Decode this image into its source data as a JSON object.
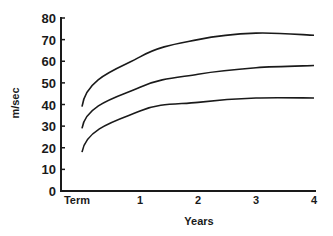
{
  "chart_data": {
    "type": "line",
    "title": "",
    "xlabel": "Years",
    "ylabel": "m/sec",
    "x_tick_labels": [
      "Term",
      "1",
      "2",
      "3",
      "4"
    ],
    "x": [
      0,
      1,
      2,
      3,
      4
    ],
    "y_ticks": [
      0,
      10,
      20,
      30,
      40,
      50,
      60,
      70,
      80
    ],
    "ylim": [
      0,
      80
    ],
    "xlim": [
      0,
      4
    ],
    "grid": false,
    "legend": null,
    "series": [
      {
        "name": "upper",
        "values": [
          39,
          62,
          70,
          73,
          72
        ]
      },
      {
        "name": "middle",
        "values": [
          29,
          48,
          54,
          57,
          58
        ]
      },
      {
        "name": "lower",
        "values": [
          18,
          37,
          41,
          43,
          43
        ]
      }
    ]
  }
}
